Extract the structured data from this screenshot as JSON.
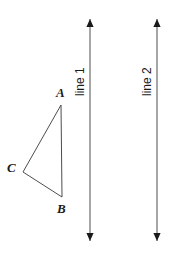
{
  "figure": {
    "width": 174,
    "height": 256,
    "background_color": "#ffffff",
    "stroke_color": "#4d4d4d",
    "text_color": "#1a1a1a",
    "triangle": {
      "name": "triangle-ABC",
      "vertices": [
        {
          "label": "A",
          "x": 61,
          "y": 105
        },
        {
          "label": "C",
          "x": 23,
          "y": 172
        },
        {
          "label": "B",
          "x": 62,
          "y": 197
        }
      ],
      "labels": {
        "A": {
          "text": "A",
          "x": 56,
          "y": 86
        },
        "B": {
          "text": "B",
          "x": 57,
          "y": 202
        },
        "C": {
          "text": "C",
          "x": 7,
          "y": 161
        }
      }
    },
    "lines": [
      {
        "name": "line-1",
        "label": "line 1",
        "x": 90,
        "y_top": 19,
        "y_bottom": 241,
        "label_x": 86,
        "label_y": 84,
        "arrow_top": true,
        "arrow_bottom": true
      },
      {
        "name": "line-2",
        "label": "line 2",
        "x": 157,
        "y_top": 19,
        "y_bottom": 241,
        "label_x": 153,
        "label_y": 84,
        "arrow_top": true,
        "arrow_bottom": true
      }
    ]
  }
}
